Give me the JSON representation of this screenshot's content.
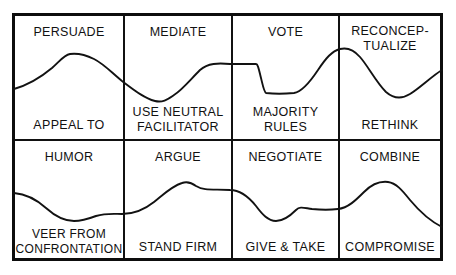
{
  "diagram": {
    "type": "2x4 grid of paired strategy labels with an overlaid wavy trend line",
    "stroke_color": "#121212",
    "background_color": "#ffffff",
    "border_color": "#0d0d0d",
    "grid": {
      "rows": 2,
      "columns": 4
    },
    "cells": [
      {
        "id": "cell-1-1",
        "row": 1,
        "column": 1,
        "top_label": "PERSUADE",
        "bottom_label": "APPEAL TO"
      },
      {
        "id": "cell-1-2",
        "row": 1,
        "column": 2,
        "top_label": "MEDIATE",
        "bottom_label": "USE NEUTRAL\nFACILITATOR"
      },
      {
        "id": "cell-1-3",
        "row": 1,
        "column": 3,
        "top_label": "VOTE",
        "bottom_label": "MAJORITY\nRULES"
      },
      {
        "id": "cell-1-4",
        "row": 1,
        "column": 4,
        "top_label": "RECONCEP-\nTUALIZE",
        "bottom_label": "RETHINK"
      },
      {
        "id": "cell-2-1",
        "row": 2,
        "column": 1,
        "top_label": "HUMOR",
        "bottom_label": "VEER FROM\nCONFRONTATION"
      },
      {
        "id": "cell-2-2",
        "row": 2,
        "column": 2,
        "top_label": "ARGUE",
        "bottom_label": "STAND FIRM"
      },
      {
        "id": "cell-2-3",
        "row": 2,
        "column": 3,
        "top_label": "NEGOTIATE",
        "bottom_label": "GIVE & TAKE"
      },
      {
        "id": "cell-2-4",
        "row": 2,
        "column": 4,
        "top_label": "COMBINE",
        "bottom_label": "COMPROMISE"
      }
    ],
    "wave_paths": {
      "top_row": "M 14,89 C 28,85 40,78 52,68 C 60,61 64,55 70,54 C 78,53 86,55 94,59 C 104,64 112,73 122,81 C 134,90 144,98 155,101 C 163,103 168,99 174,95 C 182,90 190,80 200,70 C 208,63 218,63 230,64 C 240,64 250,64 256,64 C 258,64 259,70 261,78 C 263,86 264,92 266,93 C 274,94 284,94 294,93 C 302,92 310,82 318,70 C 326,58 332,51 340,49 C 348,47 354,50 360,57 C 368,66 376,82 386,92 C 394,99 402,99 410,94 C 420,88 432,76 442,70",
      "bottom_row": "M 14,193 C 26,194 36,199 46,208 C 56,217 64,221 74,221 C 82,221 88,219 96,216 C 106,213 114,214 122,214 C 134,214 144,210 154,202 C 164,194 172,186 182,183 C 188,181 192,183 196,186 C 204,191 214,189 230,190 C 240,190 248,196 256,206 C 262,214 268,221 276,221 C 284,221 290,216 296,210 C 300,206 304,208 312,209 C 322,210 330,210 338,209 C 348,208 356,200 364,192 C 372,184 380,181 388,182 C 396,183 402,190 410,200 C 420,212 432,222 442,227"
    }
  }
}
